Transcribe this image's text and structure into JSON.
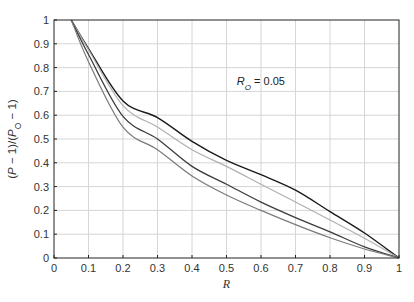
{
  "chart_data": {
    "type": "line",
    "title": "",
    "xlabel": "R",
    "ylabel": "(P − 1)/(P_O − 1)",
    "xlim": [
      0,
      1
    ],
    "ylim": [
      0,
      1
    ],
    "grid": true,
    "legend": null,
    "x_ticks": [
      "0",
      "0.1",
      "0.2",
      "0.3",
      "0.4",
      "0.5",
      "0.6",
      "0.7",
      "0.8",
      "0.9",
      "1"
    ],
    "y_ticks": [
      "0",
      "0.1",
      "0.2",
      "0.3",
      "0.4",
      "0.5",
      "0.6",
      "0.7",
      "0.8",
      "0.9",
      "1"
    ],
    "annotations": [
      {
        "text_main": "R",
        "text_sub": "O",
        "text_rest": " = 0.05",
        "x": 0.53,
        "y": 0.725
      }
    ],
    "x": [
      0.05,
      0.1,
      0.2,
      0.3,
      0.4,
      0.5,
      0.6,
      0.7,
      0.8,
      0.9,
      1.0
    ],
    "series": [
      {
        "name": "curve-1-dark-top",
        "color": "#1a1a1a",
        "width": 1.4,
        "values": [
          1.0,
          0.88,
          0.66,
          0.59,
          0.49,
          0.41,
          0.35,
          0.285,
          0.195,
          0.105,
          0.0
        ]
      },
      {
        "name": "curve-2-light-gray",
        "color": "#b0b0b0",
        "width": 1.2,
        "values": [
          1.0,
          0.875,
          0.64,
          0.55,
          0.455,
          0.385,
          0.31,
          0.235,
          0.16,
          0.083,
          0.0
        ]
      },
      {
        "name": "curve-3-dark-middle",
        "color": "#3c3c3c",
        "width": 1.3,
        "values": [
          1.0,
          0.855,
          0.595,
          0.5,
          0.385,
          0.31,
          0.235,
          0.17,
          0.11,
          0.047,
          0.0
        ]
      },
      {
        "name": "curve-4-gray-bottom",
        "color": "#7a7a7a",
        "width": 1.2,
        "values": [
          1.0,
          0.825,
          0.55,
          0.455,
          0.345,
          0.265,
          0.2,
          0.14,
          0.085,
          0.038,
          0.0
        ]
      }
    ]
  }
}
